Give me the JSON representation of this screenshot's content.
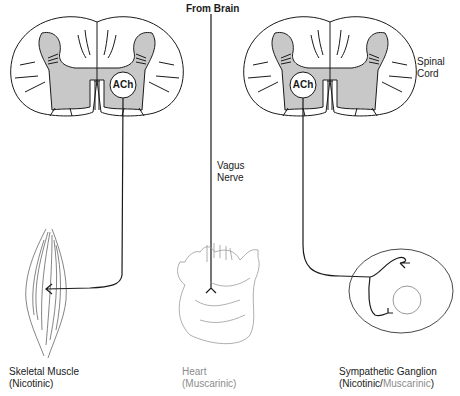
{
  "diagram": {
    "top_label": "From Brain",
    "spinal_cord_label": [
      "Spinal",
      "Cord"
    ],
    "vagus_label": [
      "Vagus",
      "Nerve"
    ],
    "left_cord": {
      "transmitter": "ACh"
    },
    "right_cord": {
      "transmitter": "ACh"
    },
    "targets": [
      {
        "name": "Skeletal Muscle",
        "receptor": "(Nicotinic)",
        "color": "#1a1a1a"
      },
      {
        "name": "Heart",
        "receptor": "(Muscarinic)",
        "color": "#8c8c8c"
      },
      {
        "name": "Sympathetic Ganglion",
        "receptor_parts": [
          "(Nicotinic/",
          "Muscarinic",
          ")"
        ],
        "colors": [
          "#1a1a1a",
          "#8c8c8c",
          "#1a1a1a"
        ]
      }
    ],
    "colors": {
      "gray_matter": "#c8c8c8",
      "line": "#1a1a1a",
      "heart": "#9a9a9a"
    }
  }
}
